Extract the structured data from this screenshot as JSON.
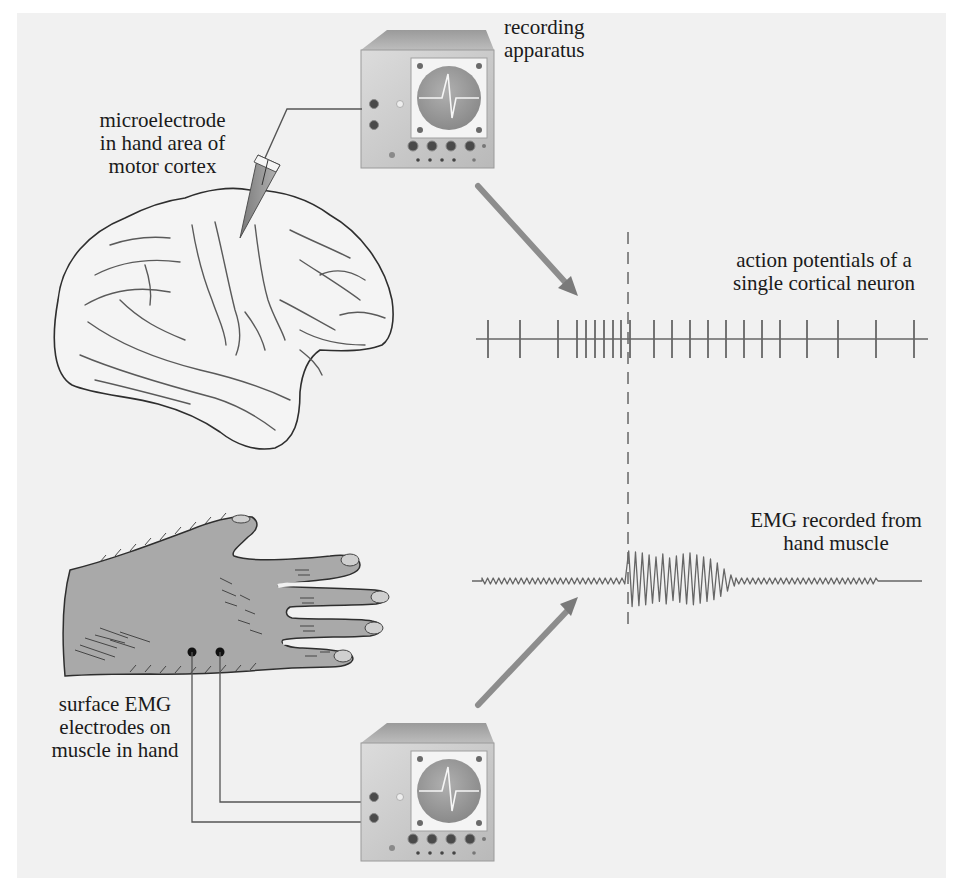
{
  "figure": {
    "background_color": "#f1f1f1",
    "line_color": "#555555",
    "trace_color": "#666666",
    "skin_color": "#a9a9a9",
    "apparatus_color": "#c8c8c8"
  },
  "labels": {
    "recording_apparatus": {
      "line1": "recording",
      "line2": "apparatus"
    },
    "microelectrode": {
      "line1": "microelectrode",
      "line2": "in hand area of",
      "line3": "motor cortex"
    },
    "action_potentials": {
      "line1": "action potentials of a",
      "line2": "single cortical neuron"
    },
    "emg_recorded": {
      "line1": "EMG recorded from",
      "line2": "hand muscle"
    },
    "surface_emg": {
      "line1": "surface EMG",
      "line2": "electrodes on",
      "line3": "muscle in hand"
    }
  },
  "spike_train": {
    "baseline_x_start": 476,
    "baseline_x_end": 928,
    "baseline_y": 339,
    "spike_top": 320,
    "spike_bottom": 358,
    "spike_x": [
      488,
      520,
      558,
      577,
      586,
      595,
      604,
      613,
      621,
      630,
      654,
      672,
      690,
      708,
      726,
      744,
      762,
      780,
      807,
      838,
      876,
      914
    ]
  },
  "emg_trace": {
    "x_start": 472,
    "x_end": 922,
    "baseline_y": 581,
    "noise_end_left": 626,
    "burst_start": 627,
    "burst_end": 736,
    "noise_end_right": 878,
    "burst_amplitudes": [
      30,
      29,
      28,
      26,
      24,
      27,
      23,
      25,
      27,
      28,
      26,
      24,
      22,
      18,
      12,
      6
    ]
  },
  "onset_marker": {
    "x": 628,
    "y_top": 232,
    "y_bottom": 630
  }
}
